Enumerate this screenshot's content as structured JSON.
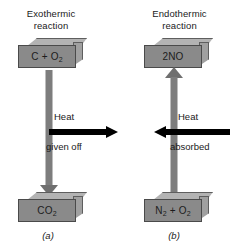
{
  "figure": {
    "panels": [
      {
        "id": "a",
        "heading": "Exothermic\nreaction",
        "caption": "(a)",
        "reactant_box": {
          "formula_html": "C + O",
          "subscript": "2",
          "label": "C + O2"
        },
        "product_box": {
          "formula_html": "CO",
          "subscript": "2",
          "label": "CO2"
        },
        "reaction_arrow": {
          "direction": "down",
          "color": "#7d7d7d"
        },
        "heat_arrow": {
          "direction": "right",
          "color": "#000000",
          "label_top": "Heat",
          "label_bottom": "given off"
        }
      },
      {
        "id": "b",
        "heading": "Endothermic\nreaction",
        "caption": "(b)",
        "reactant_box": {
          "formula_html": "N",
          "subscript": "2",
          "label": "N2 + O2"
        },
        "product_box": {
          "formula_html": "2NO",
          "subscript": "",
          "label": "2NO"
        },
        "reaction_arrow": {
          "direction": "up",
          "color": "#7d7d7d"
        },
        "heat_arrow": {
          "direction": "left",
          "color": "#000000",
          "label_top": "Heat",
          "label_bottom": "absorbed"
        }
      }
    ],
    "colors": {
      "box_face": "#8a8a8a",
      "box_top": "#b3b3b3",
      "box_side": "#a0a0a0",
      "box_outline": "#4a4a4a",
      "arrow_gray": "#7d7d7d",
      "arrow_black": "#000000",
      "text": "#1a1a1a",
      "background": "#ffffff"
    },
    "labels": {
      "heat": "Heat",
      "given_off": "given off",
      "absorbed": "absorbed",
      "n2_o2_part1": "N",
      "n2_o2_mid": " + O",
      "n2_o2_sub1": "2",
      "n2_o2_sub2": "2",
      "c_o2_part1": "C + O",
      "c_o2_sub": "2",
      "co2_part1": "CO",
      "co2_sub": "2",
      "no_text": "2NO"
    }
  }
}
